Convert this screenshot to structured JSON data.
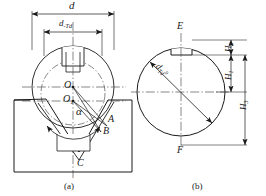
{
  "figure": {
    "line_color": "#1a1a1a",
    "centerline_color": "#555555",
    "background": "#ffffff"
  },
  "captions": {
    "left": "(a)",
    "right": "(b)"
  },
  "diagram_a": {
    "name": "shaft-in-vee-block",
    "dimensions": {
      "outer_diameter": {
        "symbol": "d",
        "label": "d"
      },
      "reduced_diameter": {
        "symbol": "d-Td",
        "base": "d",
        "sub": "-Td",
        "label": "d-Td"
      }
    },
    "points": [
      {
        "id": "O",
        "label": "O",
        "sub": "",
        "x": 72,
        "y": 87
      },
      {
        "id": "O1",
        "label": "O",
        "sub": "1",
        "x": 72,
        "y": 101
      },
      {
        "id": "A",
        "label": "A",
        "sub": "",
        "x": 110,
        "y": 122
      },
      {
        "id": "B",
        "label": "B",
        "sub": "",
        "x": 104,
        "y": 131
      },
      {
        "id": "C",
        "label": "C",
        "sub": "",
        "x": 79,
        "y": 162
      }
    ],
    "angle": {
      "symbol": "alpha",
      "label": "α",
      "x": 80,
      "y": 112
    }
  },
  "diagram_b": {
    "name": "shaft-cross-section",
    "diameter_label": {
      "base": "d",
      "sub": "T",
      "sub2": "d",
      "sup": "0",
      "label": "d-Td"
    },
    "axis_points": [
      {
        "id": "E",
        "label": "E",
        "x": 181,
        "y": 30
      },
      {
        "id": "F",
        "label": "F",
        "x": 181,
        "y": 153
      }
    ],
    "heights": [
      {
        "id": "H2",
        "base": "H",
        "sub": "2",
        "label": "H2"
      },
      {
        "id": "H1",
        "base": "H",
        "sub": "1",
        "label": "H1"
      },
      {
        "id": "H3",
        "base": "H",
        "sub": "3",
        "label": "H3"
      }
    ]
  }
}
